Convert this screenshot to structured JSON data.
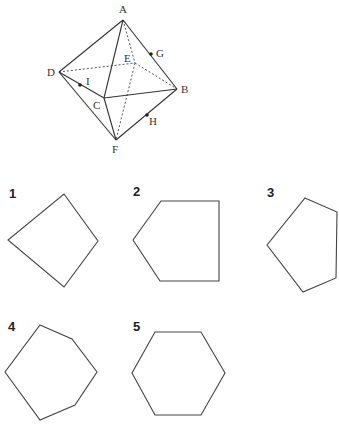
{
  "octahedron": {
    "vertices": {
      "A": {
        "label": "A",
        "x": 123,
        "y": 20
      },
      "B": {
        "label": "B",
        "x": 177,
        "y": 89
      },
      "C": {
        "label": "C",
        "x": 104,
        "y": 98
      },
      "D": {
        "label": "D",
        "x": 59,
        "y": 72
      },
      "E": {
        "label": "E",
        "x": 135,
        "y": 63
      },
      "F": {
        "label": "F",
        "x": 116,
        "y": 140
      }
    },
    "midpoints": {
      "G": {
        "label": "G",
        "x": 151,
        "y": 54
      },
      "H": {
        "label": "H",
        "x": 147,
        "y": 115
      },
      "I": {
        "label": "I",
        "x": 80,
        "y": 85
      }
    },
    "visible_edges": [
      "AD",
      "AC",
      "AB",
      "DC",
      "DF",
      "CB",
      "CF",
      "FB"
    ],
    "hidden_edges": [
      "AE",
      "DE",
      "EB",
      "EF"
    ]
  },
  "options": [
    {
      "number": "1",
      "sides": 4,
      "points": "64,194 98,241 64,287 8,240"
    },
    {
      "number": "2",
      "sides": 5,
      "points": "161,201 219,201 219,281 160,281 133,240"
    },
    {
      "number": "3",
      "sides": 5,
      "points": "305,198 337,212 336,278 303,292 267,245"
    },
    {
      "number": "4",
      "sides": 6,
      "points": "40,325 72,339 97,372 75,405 40,420 5,372"
    },
    {
      "number": "5",
      "sides": 6,
      "points": "155,332 201,332 225,373 201,415 155,415 132,373"
    }
  ]
}
